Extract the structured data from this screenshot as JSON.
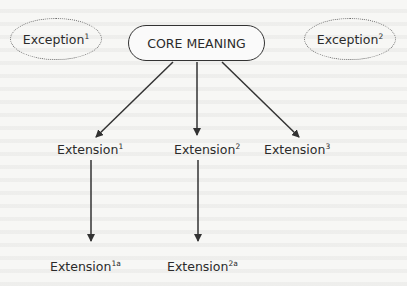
{
  "diagram": {
    "type": "semantic-extension-tree",
    "core": {
      "label": "CORE MEANING"
    },
    "exceptions": [
      {
        "label": "Exception",
        "sup": "1"
      },
      {
        "label": "Exception",
        "sup": "2"
      }
    ],
    "extensions": [
      {
        "label": "Extension",
        "sup": "1"
      },
      {
        "label": "Extension",
        "sup": "2"
      },
      {
        "label": "Extension",
        "sup": "3"
      }
    ],
    "sub_extensions": [
      {
        "label": "Extension",
        "sup": "1a",
        "parent": "Extension1"
      },
      {
        "label": "Extension",
        "sup": "2a",
        "parent": "Extension2"
      }
    ],
    "edges": [
      {
        "from": "CORE MEANING",
        "to": "Extension1"
      },
      {
        "from": "CORE MEANING",
        "to": "Extension2"
      },
      {
        "from": "CORE MEANING",
        "to": "Extension3"
      },
      {
        "from": "Extension1",
        "to": "Extension1a"
      },
      {
        "from": "Extension2",
        "to": "Extension2a"
      }
    ],
    "colors": {
      "background": "#f7f7f5",
      "stroke": "#333333",
      "dotted_outline": "#666666",
      "text": "#2b2b2b"
    }
  }
}
